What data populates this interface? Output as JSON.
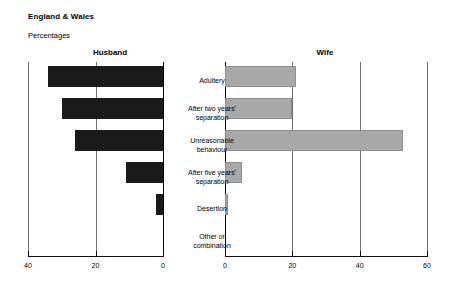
{
  "header": {
    "title": "England & Wales",
    "subtitle": "Percentages"
  },
  "panels": {
    "left_heading": "Husband",
    "right_heading": "Wife"
  },
  "chart_data": {
    "type": "bar",
    "orientation": "horizontal",
    "layout": "back-to-back pyramid",
    "title": "England & Wales",
    "subtitle": "Percentages",
    "xlabel": "",
    "ylabel": "",
    "grid": true,
    "legend_position": "panel-headings",
    "categories": [
      "Adultery",
      "After two years' separation",
      "Unreasonable behaviour",
      "After five years' separation",
      "Desertion",
      "Other or combination"
    ],
    "category_lines": [
      [
        "Adultery"
      ],
      [
        "After two years'",
        "separation"
      ],
      [
        "Unreasonable",
        "behaviour"
      ],
      [
        "After five years'",
        "separation"
      ],
      [
        "Desertion"
      ],
      [
        "Other or",
        "combination"
      ]
    ],
    "series": [
      {
        "name": "Husband",
        "axis": "left",
        "direction": "reversed",
        "color": "#1a1a1a",
        "xlim": [
          0,
          40
        ],
        "ticks": [
          40,
          20,
          0
        ],
        "values": [
          34,
          30,
          26,
          11,
          2,
          0
        ]
      },
      {
        "name": "Wife",
        "axis": "right",
        "direction": "normal",
        "color": "#a8a8a8",
        "xlim": [
          0,
          60
        ],
        "ticks": [
          0,
          20,
          40,
          60
        ],
        "values": [
          21,
          20,
          53,
          5,
          1,
          0
        ]
      }
    ]
  },
  "axes": {
    "left_ticks": [
      "40",
      "20",
      "0"
    ],
    "right_ticks": [
      "0",
      "20",
      "40",
      "60"
    ]
  }
}
